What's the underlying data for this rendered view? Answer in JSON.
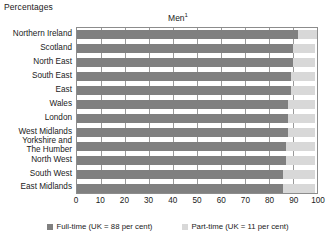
{
  "units_label": "Percentages",
  "title": "Men",
  "title_footnote": "1",
  "colors": {
    "full_time": "#808080",
    "part_time": "#d8d8d8",
    "plot_border": "#8c8c8c",
    "gridline": "#9a9a9a",
    "background": "#ffffff"
  },
  "legend": {
    "position": "bottom",
    "items": [
      {
        "label": "Full-time (UK = 88 per cent)",
        "swatch": "full_time"
      },
      {
        "label": "Part-time (UK = 11 per cent)",
        "swatch": "part_time"
      }
    ]
  },
  "axis": {
    "x_ticks": [
      "0",
      "10",
      "20",
      "30",
      "40",
      "50",
      "60",
      "70",
      "80",
      "90",
      "100"
    ],
    "x_min": 0,
    "x_max": 100
  },
  "chart_data": {
    "type": "bar",
    "orientation": "horizontal",
    "stacked": true,
    "title": "Men",
    "xlabel": "",
    "ylabel": "",
    "units": "Percentages",
    "xlim": [
      0,
      100
    ],
    "grid": true,
    "legend_position": "bottom",
    "categories": [
      "Northern Ireland",
      "Scotland",
      "North East",
      "South East",
      "East",
      "Wales",
      "London",
      "West Midlands",
      "Yorkshire and The Humber",
      "North West",
      "South West",
      "East Midlands"
    ],
    "series": [
      {
        "name": "Full-time (UK = 88 per cent)",
        "values": [
          92,
          90,
          90,
          89,
          89,
          88,
          88,
          88,
          87,
          87,
          86,
          86
        ]
      },
      {
        "name": "Part-time (UK = 11 per cent)",
        "values": [
          8,
          9,
          9,
          10,
          10,
          11,
          11,
          11,
          12,
          12,
          13,
          13
        ]
      }
    ]
  }
}
